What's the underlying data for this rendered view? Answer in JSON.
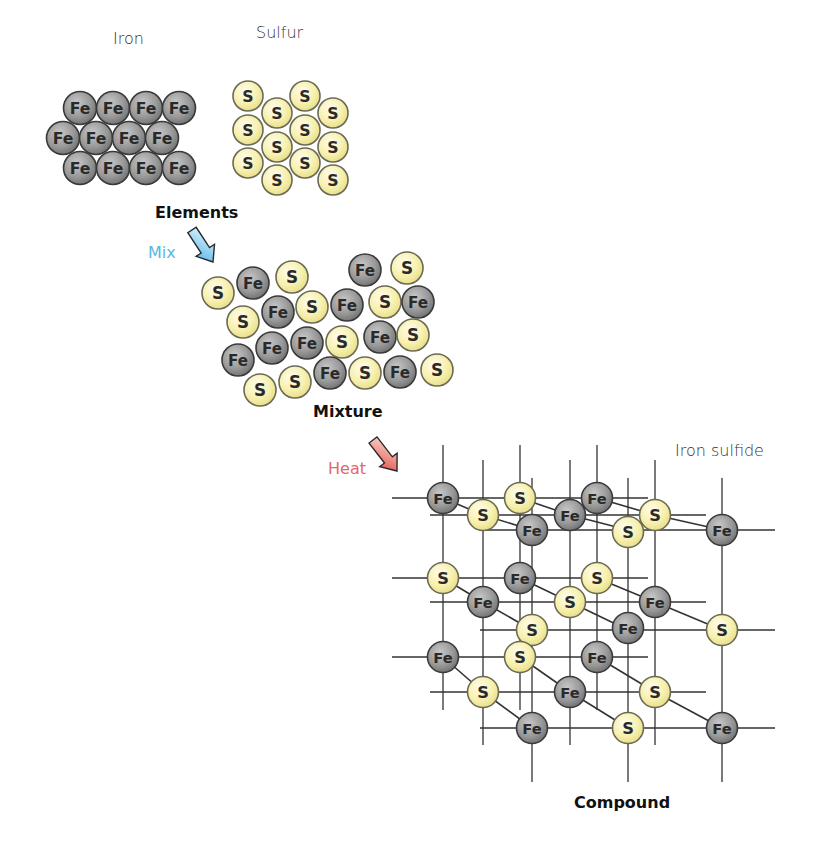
{
  "colors": {
    "fe_fill": "#8e8e8e",
    "fe_fill_light": "#b5b5b5",
    "fe_stroke": "#3a3a3a",
    "s_fill": "#f7f1b0",
    "s_fill_light": "#fdfbe4",
    "s_stroke": "#6a6a55",
    "bond": "#333333",
    "mix_arrow": "#6cc3ef",
    "heat_arrow": "#e8584a",
    "text": "#222222"
  },
  "labels": {
    "iron": {
      "text": "Iron",
      "x": 113,
      "y": 29
    },
    "sulfur": {
      "text": "Sulfur",
      "x": 256,
      "y": 23
    },
    "elements": {
      "text": "Elements",
      "x": 155,
      "y": 203
    },
    "mix": {
      "text": "Mix",
      "x": 148,
      "y": 243
    },
    "mixture": {
      "text": "Mixture",
      "x": 313,
      "y": 402
    },
    "heat": {
      "text": "Heat",
      "x": 328,
      "y": 459
    },
    "iron_sulfide": {
      "text": "Iron sulfide",
      "x": 675,
      "y": 441
    },
    "compound": {
      "text": "Compound",
      "x": 574,
      "y": 793
    }
  },
  "symbols": {
    "iron": "Fe",
    "sulfur": "S"
  },
  "arrows": [
    {
      "name": "mix-arrow",
      "x1": 192,
      "y1": 230,
      "x2": 213,
      "y2": 262,
      "color": "#6cc3ef"
    },
    {
      "name": "heat-arrow",
      "x1": 373,
      "y1": 440,
      "x2": 397,
      "y2": 471,
      "color": "#e8584a"
    }
  ],
  "groups": {
    "iron_element": {
      "radius": 16.5,
      "atoms": [
        {
          "el": "Fe",
          "x": 80,
          "y": 108
        },
        {
          "el": "Fe",
          "x": 113,
          "y": 108
        },
        {
          "el": "Fe",
          "x": 146,
          "y": 108
        },
        {
          "el": "Fe",
          "x": 179,
          "y": 108
        },
        {
          "el": "Fe",
          "x": 63,
          "y": 138
        },
        {
          "el": "Fe",
          "x": 96,
          "y": 138
        },
        {
          "el": "Fe",
          "x": 129,
          "y": 138
        },
        {
          "el": "Fe",
          "x": 162,
          "y": 138
        },
        {
          "el": "Fe",
          "x": 80,
          "y": 168
        },
        {
          "el": "Fe",
          "x": 113,
          "y": 168
        },
        {
          "el": "Fe",
          "x": 146,
          "y": 168
        },
        {
          "el": "Fe",
          "x": 179,
          "y": 168
        }
      ]
    },
    "sulfur_element": {
      "radius": 15,
      "atoms": [
        {
          "el": "S",
          "x": 248,
          "y": 96
        },
        {
          "el": "S",
          "x": 248,
          "y": 130
        },
        {
          "el": "S",
          "x": 248,
          "y": 163
        },
        {
          "el": "S",
          "x": 277,
          "y": 113
        },
        {
          "el": "S",
          "x": 277,
          "y": 147
        },
        {
          "el": "S",
          "x": 277,
          "y": 180
        },
        {
          "el": "S",
          "x": 305,
          "y": 96
        },
        {
          "el": "S",
          "x": 305,
          "y": 130
        },
        {
          "el": "S",
          "x": 305,
          "y": 163
        },
        {
          "el": "S",
          "x": 333,
          "y": 113
        },
        {
          "el": "S",
          "x": 333,
          "y": 147
        },
        {
          "el": "S",
          "x": 333,
          "y": 180
        }
      ]
    },
    "mixture": {
      "radius": 16,
      "atoms": [
        {
          "el": "S",
          "x": 218,
          "y": 293
        },
        {
          "el": "Fe",
          "x": 253,
          "y": 283
        },
        {
          "el": "S",
          "x": 292,
          "y": 277
        },
        {
          "el": "Fe",
          "x": 365,
          "y": 270
        },
        {
          "el": "S",
          "x": 407,
          "y": 268
        },
        {
          "el": "S",
          "x": 243,
          "y": 322
        },
        {
          "el": "Fe",
          "x": 278,
          "y": 312
        },
        {
          "el": "S",
          "x": 312,
          "y": 307
        },
        {
          "el": "Fe",
          "x": 347,
          "y": 305
        },
        {
          "el": "S",
          "x": 385,
          "y": 302
        },
        {
          "el": "Fe",
          "x": 418,
          "y": 302
        },
        {
          "el": "Fe",
          "x": 238,
          "y": 360
        },
        {
          "el": "Fe",
          "x": 272,
          "y": 348
        },
        {
          "el": "Fe",
          "x": 307,
          "y": 343
        },
        {
          "el": "S",
          "x": 342,
          "y": 342
        },
        {
          "el": "Fe",
          "x": 380,
          "y": 337
        },
        {
          "el": "S",
          "x": 413,
          "y": 335
        },
        {
          "el": "S",
          "x": 260,
          "y": 390
        },
        {
          "el": "S",
          "x": 295,
          "y": 382
        },
        {
          "el": "Fe",
          "x": 330,
          "y": 373
        },
        {
          "el": "S",
          "x": 365,
          "y": 373
        },
        {
          "el": "Fe",
          "x": 400,
          "y": 372
        },
        {
          "el": "S",
          "x": 437,
          "y": 370
        }
      ]
    },
    "compound": {
      "radius": 15.5,
      "h_lines": [
        {
          "y": 498,
          "x1": 392,
          "x2": 648
        },
        {
          "y": 515,
          "x1": 430,
          "x2": 706
        },
        {
          "y": 530,
          "x1": 480,
          "x2": 775
        },
        {
          "y": 578,
          "x1": 392,
          "x2": 648
        },
        {
          "y": 602,
          "x1": 430,
          "x2": 706
        },
        {
          "y": 630,
          "x1": 480,
          "x2": 775
        },
        {
          "y": 657,
          "x1": 392,
          "x2": 648
        },
        {
          "y": 692,
          "x1": 430,
          "x2": 706
        },
        {
          "y": 728,
          "x1": 480,
          "x2": 775
        }
      ],
      "v_lines": [
        {
          "x": 443,
          "y1": 445,
          "y2": 710
        },
        {
          "x": 520,
          "y1": 445,
          "y2": 710
        },
        {
          "x": 597,
          "y1": 445,
          "y2": 710
        },
        {
          "x": 483,
          "y1": 460,
          "y2": 745
        },
        {
          "x": 570,
          "y1": 460,
          "y2": 745
        },
        {
          "x": 655,
          "y1": 460,
          "y2": 745
        },
        {
          "x": 532,
          "y1": 478,
          "y2": 782
        },
        {
          "x": 628,
          "y1": 478,
          "y2": 782
        },
        {
          "x": 722,
          "y1": 478,
          "y2": 782
        }
      ],
      "bonds": [
        [
          443,
          498,
          483,
          515
        ],
        [
          483,
          515,
          532,
          530
        ],
        [
          520,
          498,
          570,
          515
        ],
        [
          570,
          515,
          628,
          530
        ],
        [
          597,
          498,
          655,
          515
        ],
        [
          655,
          515,
          722,
          530
        ],
        [
          443,
          578,
          483,
          602
        ],
        [
          483,
          602,
          532,
          630
        ],
        [
          520,
          578,
          570,
          602
        ],
        [
          570,
          602,
          628,
          630
        ],
        [
          597,
          578,
          655,
          602
        ],
        [
          655,
          602,
          722,
          630
        ],
        [
          443,
          657,
          483,
          692
        ],
        [
          483,
          692,
          532,
          728
        ],
        [
          520,
          657,
          570,
          692
        ],
        [
          570,
          692,
          628,
          728
        ],
        [
          597,
          657,
          655,
          692
        ],
        [
          655,
          692,
          722,
          728
        ]
      ],
      "atoms": [
        {
          "el": "Fe",
          "x": 443,
          "y": 498
        },
        {
          "el": "S",
          "x": 520,
          "y": 498
        },
        {
          "el": "Fe",
          "x": 597,
          "y": 498
        },
        {
          "el": "S",
          "x": 483,
          "y": 515
        },
        {
          "el": "Fe",
          "x": 570,
          "y": 515
        },
        {
          "el": "S",
          "x": 655,
          "y": 515
        },
        {
          "el": "Fe",
          "x": 532,
          "y": 530
        },
        {
          "el": "S",
          "x": 628,
          "y": 532
        },
        {
          "el": "Fe",
          "x": 722,
          "y": 530
        },
        {
          "el": "S",
          "x": 443,
          "y": 578
        },
        {
          "el": "Fe",
          "x": 520,
          "y": 578
        },
        {
          "el": "S",
          "x": 597,
          "y": 578
        },
        {
          "el": "Fe",
          "x": 483,
          "y": 602
        },
        {
          "el": "S",
          "x": 570,
          "y": 602
        },
        {
          "el": "Fe",
          "x": 655,
          "y": 602
        },
        {
          "el": "S",
          "x": 532,
          "y": 630
        },
        {
          "el": "Fe",
          "x": 628,
          "y": 628
        },
        {
          "el": "S",
          "x": 722,
          "y": 630
        },
        {
          "el": "Fe",
          "x": 443,
          "y": 657
        },
        {
          "el": "S",
          "x": 520,
          "y": 657
        },
        {
          "el": "Fe",
          "x": 597,
          "y": 657
        },
        {
          "el": "S",
          "x": 483,
          "y": 692
        },
        {
          "el": "Fe",
          "x": 570,
          "y": 692
        },
        {
          "el": "S",
          "x": 655,
          "y": 692
        },
        {
          "el": "Fe",
          "x": 532,
          "y": 728
        },
        {
          "el": "S",
          "x": 628,
          "y": 728
        },
        {
          "el": "Fe",
          "x": 722,
          "y": 728
        }
      ]
    }
  }
}
